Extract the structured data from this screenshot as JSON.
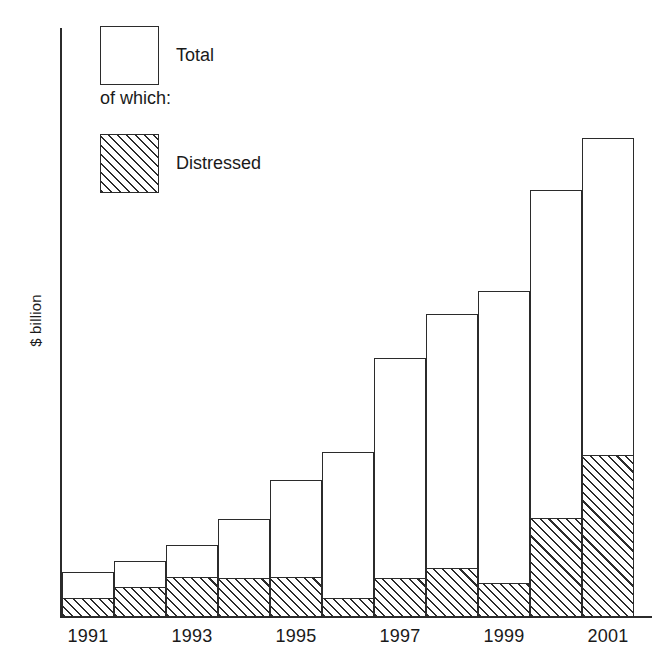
{
  "chart_data": {
    "type": "bar",
    "title": "",
    "subtitle": "",
    "xlabel": "",
    "ylabel": "$ billion",
    "stacked": true,
    "grid": false,
    "legend_position": "top-left",
    "axis": {
      "y_title": "$ billion",
      "y_ticks_shown": false,
      "x_tick_labels": [
        "1991",
        "1993",
        "1995",
        "1997",
        "1999",
        "2001"
      ],
      "x_tick_label_all_years": [
        "1991",
        "1992",
        "1993",
        "1994",
        "1995",
        "1996",
        "1997",
        "1998",
        "1999",
        "2000",
        "2001"
      ]
    },
    "categories": [
      "1991",
      "1992",
      "1993",
      "1994",
      "1995",
      "1996",
      "1997",
      "1998",
      "1999",
      "2000",
      "2001"
    ],
    "series": [
      {
        "name": "Total",
        "fill": "white",
        "values": [
          9.4,
          11.7,
          15.0,
          20.5,
          28.6,
          34.4,
          54.1,
          63.3,
          68.1,
          89.1,
          100.0
        ]
      },
      {
        "name": "Distressed",
        "fill": "hatched",
        "values": [
          4.0,
          6.3,
          8.4,
          8.1,
          8.4,
          4.0,
          8.1,
          10.2,
          7.1,
          20.7,
          33.8
        ]
      }
    ],
    "pixel_geometry": {
      "baseline_y": 617,
      "bar_width_px": 52,
      "plot_left_px": 62,
      "total_top_y": [
        572,
        561,
        545,
        519,
        480,
        452,
        358,
        314,
        291,
        190,
        138
      ],
      "distressed_top_y": [
        598,
        587,
        577,
        578,
        577,
        598,
        578,
        568,
        583,
        518,
        455
      ]
    }
  },
  "legend": {
    "total": {
      "label": "Total",
      "swatch": "empty-square"
    },
    "note": "of which:",
    "distressed": {
      "label": "Distressed",
      "swatch": "hatched-square"
    }
  },
  "colors": {
    "ink": "#2b2b2b",
    "background": "#ffffff"
  }
}
